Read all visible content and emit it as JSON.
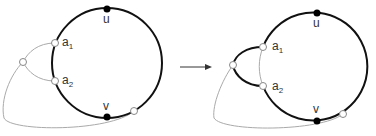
{
  "diagram": {
    "left": {
      "labels": {
        "u": "u",
        "v": "v",
        "a1": "a",
        "a1_sub": "1",
        "a2": "a",
        "a2_sub": "2"
      }
    },
    "arrow": "→",
    "right": {
      "labels": {
        "u": "u",
        "v": "v",
        "a1": "a",
        "a1_sub": "1",
        "a2": "a",
        "a2_sub": "2"
      }
    },
    "colors": {
      "thick_edge": "#111111",
      "thin_edge": "#aaaaaa",
      "filled_node": "#000000",
      "open_node": "#ffffff"
    }
  }
}
